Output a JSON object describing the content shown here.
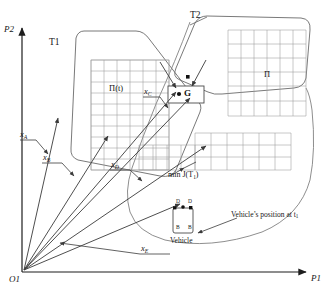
{
  "figure": {
    "type": "technical-schematic"
  },
  "axes": {
    "y_label": "P2",
    "x_label": "P1",
    "origin_label": "O1"
  },
  "regions": [
    {
      "id": "t1",
      "label": "T1"
    },
    {
      "id": "t2",
      "label": "T2"
    }
  ],
  "grids": [
    {
      "id": "grid-left",
      "label": "Π(t)",
      "cols": 6,
      "rows": 10
    },
    {
      "id": "grid-right",
      "label": "Π",
      "cols": 7,
      "rows": 6
    },
    {
      "id": "grid-lower",
      "label": "",
      "cols": 7,
      "rows": 3
    },
    {
      "id": "grid-lower-left",
      "label": "",
      "cols": 4,
      "rows": 2
    }
  ],
  "goal": {
    "point_label": "G",
    "box": true
  },
  "vectors": [
    {
      "id": "x-a",
      "label": "x",
      "sub": "A"
    },
    {
      "id": "x-b",
      "label": "x",
      "sub": "B"
    },
    {
      "id": "x-c",
      "label": "x",
      "sub": "C"
    },
    {
      "id": "x-d",
      "label": "x",
      "sub": "D"
    },
    {
      "id": "x-e",
      "label": "x",
      "sub": "E"
    }
  ],
  "annotations": {
    "min_cost": "min J(T1)",
    "min_cost_main": "min ",
    "min_cost_fn": "J(T",
    "min_cost_sub": "1",
    "min_cost_close": ")",
    "vehicle_position": "Vehicle’s position at t",
    "vehicle_position_sub": "1",
    "vehicle_caption": "Vehicle",
    "vehicle_corners": [
      "D",
      "D",
      "B",
      "B"
    ]
  },
  "colors": {
    "stroke": "#5a5a5a",
    "grid": "#8c8c8c",
    "text": "#161616",
    "background": "#ffffff"
  }
}
